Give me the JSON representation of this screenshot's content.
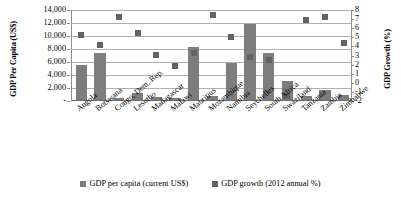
{
  "chart_data": {
    "type": "bar",
    "title": "",
    "categories": [
      "Angola",
      "Botswana",
      "Congo, Dem. Rep.",
      "Lesotho",
      "Madagascar",
      "Malawi",
      "Mauritius",
      "Mozambique",
      "Namibia",
      "Seychelles",
      "South Africa",
      "Swaziland",
      "Tanzania",
      "Zambia",
      "Zimbabwe"
    ],
    "series": [
      {
        "name": "GDP per capita (current US$)",
        "type": "bar",
        "axis": "left",
        "color": "#7d7d7d",
        "values": [
          5400,
          7200,
          260,
          1100,
          450,
          270,
          8100,
          580,
          5700,
          11700,
          7300,
          3000,
          600,
          1500,
          700
        ]
      },
      {
        "name": "GDP growth (2012 annual %)",
        "type": "scatter",
        "axis": "right",
        "color": "#636363",
        "values": [
          5.2,
          4.2,
          7.2,
          5.5,
          3.1,
          1.9,
          3.3,
          7.4,
          5.0,
          2.8,
          2.5,
          -1.5,
          6.9,
          7.2,
          4.4
        ]
      }
    ],
    "ylabel": "GDP Per Capita (US$)",
    "ylabel_right": "GDP Growth (%)",
    "xlabel": "",
    "ylim": [
      0,
      14000
    ],
    "ylim_right": [
      -2,
      8
    ],
    "yticks_left": [
      "-",
      "2,000",
      "4,000",
      "6,000",
      "8,000",
      "10,000",
      "12,000",
      "14,000"
    ],
    "yticks_right": [
      "-2",
      "-1",
      "0",
      "1",
      "2",
      "3",
      "4",
      "5",
      "6",
      "7",
      "8"
    ],
    "grid": true,
    "legend_position": "bottom"
  },
  "legend": {
    "items": [
      {
        "label": "GDP per capita (current US$)",
        "color": "#7d7d7d"
      },
      {
        "label": "GDP growth (2012 annual %)",
        "color": "#636363"
      }
    ]
  }
}
